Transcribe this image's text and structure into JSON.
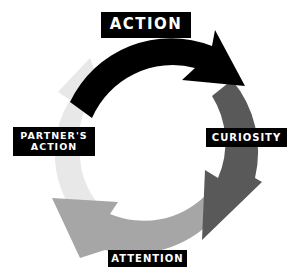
{
  "diagram": {
    "type": "cycle",
    "stages": [
      {
        "label": "ACTION",
        "color": "#000000"
      },
      {
        "label": "CURIOSITY",
        "color": "#5a5a5a"
      },
      {
        "label": "ATTENTION",
        "color": "#a8a8a8"
      },
      {
        "label_line1": "PARTNER'S",
        "label_line2": "ACTION",
        "color": "#e6e6e6"
      }
    ],
    "label_bg": "#000000",
    "label_fg": "#ffffff"
  }
}
